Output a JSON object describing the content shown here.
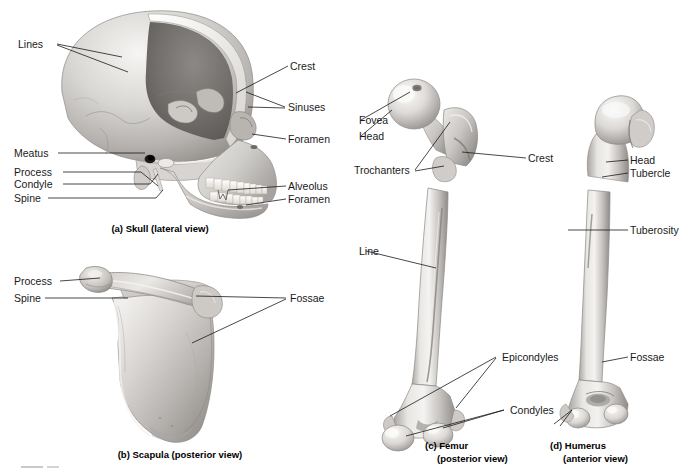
{
  "figure": {
    "background": "#ffffff",
    "ink": "#1a1a1a",
    "bone_light": "#f2f1ef",
    "bone_mid": "#c9c7c4",
    "bone_dark": "#8d8b88",
    "cavity_dark": "#6f6d6b"
  },
  "panels": [
    {
      "id": "a",
      "caption_line1": "(a) Skull (lateral view)",
      "caption_line2": "",
      "labels": [
        {
          "name": "lines",
          "text": "Lines"
        },
        {
          "name": "meatus",
          "text": "Meatus"
        },
        {
          "name": "process",
          "text": "Process"
        },
        {
          "name": "condyle",
          "text": "Condyle"
        },
        {
          "name": "spine",
          "text": "Spine"
        },
        {
          "name": "crest",
          "text": "Crest"
        },
        {
          "name": "sinuses",
          "text": "Sinuses"
        },
        {
          "name": "foramen-upper",
          "text": "Foramen"
        },
        {
          "name": "alveolus",
          "text": "Alveolus"
        },
        {
          "name": "foramen-lower",
          "text": "Foramen"
        }
      ]
    },
    {
      "id": "b",
      "caption_line1": "(b) Scapula (posterior view)",
      "caption_line2": "",
      "labels": [
        {
          "name": "process",
          "text": "Process"
        },
        {
          "name": "spine",
          "text": "Spine"
        },
        {
          "name": "fossae",
          "text": "Fossae"
        }
      ]
    },
    {
      "id": "c",
      "caption_line1": "(c) Femur",
      "caption_line2": "(posterior view)",
      "labels": [
        {
          "name": "fovea",
          "text": "Fovea"
        },
        {
          "name": "head",
          "text": "Head"
        },
        {
          "name": "trochanters",
          "text": "Trochanters"
        },
        {
          "name": "crest",
          "text": "Crest"
        },
        {
          "name": "line",
          "text": "Line"
        },
        {
          "name": "epicondyles",
          "text": "Epicondyles"
        },
        {
          "name": "condyles",
          "text": "Condyles"
        }
      ]
    },
    {
      "id": "d",
      "caption_line1": "(d) Humerus",
      "caption_line2": "(anterior view)",
      "labels": [
        {
          "name": "head",
          "text": "Head"
        },
        {
          "name": "tubercle",
          "text": "Tubercle"
        },
        {
          "name": "tuberosity",
          "text": "Tuberosity"
        },
        {
          "name": "fossae",
          "text": "Fossae"
        }
      ]
    }
  ],
  "skull": {
    "lines": "Lines",
    "meatus": "Meatus",
    "process": "Process",
    "condyle": "Condyle",
    "spine": "Spine",
    "crest": "Crest",
    "sinuses": "Sinuses",
    "foramen_upper": "Foramen",
    "alveolus": "Alveolus",
    "foramen_lower": "Foramen",
    "caption": "(a) Skull (lateral view)"
  },
  "scapula": {
    "process": "Process",
    "spine": "Spine",
    "fossae": "Fossae",
    "caption": "(b) Scapula (posterior view)"
  },
  "femur": {
    "fovea": "Fovea",
    "head": "Head",
    "trochanters": "Trochanters",
    "crest": "Crest",
    "line": "Line",
    "epicondyles": "Epicondyles",
    "condyles": "Condyles",
    "caption_line1": "(c) Femur",
    "caption_line2": "(posterior view)"
  },
  "humerus": {
    "head": "Head",
    "tubercle": "Tubercle",
    "tuberosity": "Tuberosity",
    "fossae": "Fossae",
    "caption_line1": "(d) Humerus",
    "caption_line2": "(anterior view)"
  }
}
